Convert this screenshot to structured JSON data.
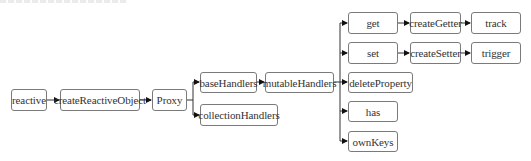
{
  "header_fragment": "",
  "colors": {
    "box_border": "#7a7a7a",
    "text": "#333333",
    "line": "#333333",
    "arrow": "#111111"
  },
  "nodes": [
    {
      "id": "reactive",
      "label": "reactive",
      "x": 11,
      "y": 89,
      "w": 36,
      "h": 22
    },
    {
      "id": "createReactiveObject",
      "label": "createReactiveObject",
      "x": 60,
      "y": 89,
      "w": 80,
      "h": 22
    },
    {
      "id": "proxy",
      "label": "Proxy",
      "x": 152,
      "y": 89,
      "w": 35,
      "h": 22
    },
    {
      "id": "baseHandlers",
      "label": "baseHandlers",
      "x": 200,
      "y": 72,
      "w": 57,
      "h": 21
    },
    {
      "id": "collectionHandlers",
      "label": "collectionHandlers",
      "x": 200,
      "y": 104,
      "w": 78,
      "h": 22
    },
    {
      "id": "mutableHandlers",
      "label": "mutableHandlers",
      "x": 265,
      "y": 72,
      "w": 69,
      "h": 21
    },
    {
      "id": "get",
      "label": "get",
      "x": 348,
      "y": 12,
      "w": 50,
      "h": 22
    },
    {
      "id": "set",
      "label": "set",
      "x": 348,
      "y": 42,
      "w": 50,
      "h": 22
    },
    {
      "id": "deleteProperty",
      "label": "deleteProperty",
      "x": 348,
      "y": 72,
      "w": 65,
      "h": 21
    },
    {
      "id": "has",
      "label": "has",
      "x": 348,
      "y": 101,
      "w": 50,
      "h": 21
    },
    {
      "id": "ownKeys",
      "label": "ownKeys",
      "x": 348,
      "y": 131,
      "w": 50,
      "h": 21
    },
    {
      "id": "createGetter",
      "label": "createGetter",
      "x": 410,
      "y": 12,
      "w": 51,
      "h": 22
    },
    {
      "id": "createSetter",
      "label": "createSetter",
      "x": 410,
      "y": 42,
      "w": 51,
      "h": 22
    },
    {
      "id": "track",
      "label": "track",
      "x": 471,
      "y": 12,
      "w": 50,
      "h": 22
    },
    {
      "id": "trigger",
      "label": "trigger",
      "x": 471,
      "y": 42,
      "w": 50,
      "h": 22
    }
  ],
  "edges": [
    {
      "from": "reactive",
      "to": "createReactiveObject"
    },
    {
      "from": "createReactiveObject",
      "to": "proxy"
    },
    {
      "from": "proxy",
      "to": "baseHandlers"
    },
    {
      "from": "proxy",
      "to": "collectionHandlers"
    },
    {
      "from": "baseHandlers",
      "to": "mutableHandlers"
    },
    {
      "from": "mutableHandlers",
      "to": "get"
    },
    {
      "from": "mutableHandlers",
      "to": "set"
    },
    {
      "from": "mutableHandlers",
      "to": "deleteProperty"
    },
    {
      "from": "mutableHandlers",
      "to": "has"
    },
    {
      "from": "mutableHandlers",
      "to": "ownKeys"
    },
    {
      "from": "get",
      "to": "createGetter"
    },
    {
      "from": "createGetter",
      "to": "track"
    },
    {
      "from": "set",
      "to": "createSetter"
    },
    {
      "from": "createSetter",
      "to": "trigger"
    }
  ]
}
